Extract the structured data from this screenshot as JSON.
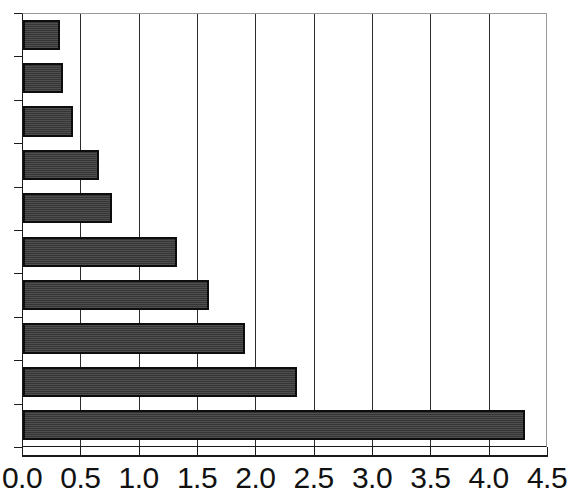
{
  "chart_data": {
    "type": "bar",
    "orientation": "horizontal",
    "title": "",
    "subtitle": "",
    "xlabel": "",
    "ylabel": "",
    "xlim": [
      0.0,
      4.5
    ],
    "xticks": [
      "0.0",
      "0.5",
      "1.0",
      "1.5",
      "2.0",
      "2.5",
      "3.0",
      "3.5",
      "4.0",
      "4.5"
    ],
    "xtick_values": [
      0.0,
      0.5,
      1.0,
      1.5,
      2.0,
      2.5,
      3.0,
      3.5,
      4.0,
      4.5
    ],
    "grid": "vertical",
    "legend": "none",
    "categories": [
      "",
      "",
      "",
      "",
      "",
      "",
      "",
      "",
      "",
      ""
    ],
    "category_labels_clipped": [
      "n",
      "n",
      "n",
      "n",
      "n",
      "n",
      "n",
      "n",
      "n",
      "n"
    ],
    "values": [
      0.32,
      0.34,
      0.43,
      0.65,
      0.76,
      1.32,
      1.59,
      1.9,
      2.35,
      4.3
    ],
    "series": [
      {
        "name": "",
        "values": [
          0.32,
          0.34,
          0.43,
          0.65,
          0.76,
          1.32,
          1.59,
          1.9,
          2.35,
          4.3
        ]
      }
    ]
  },
  "style": {
    "bar_fill": "#3b3b3b",
    "bar_border": "#0d0d0d",
    "gridline_color": "#2b2b2b",
    "axis_color": "#1a1a1a",
    "frame_color": "#9a9a9a",
    "background": "#ffffff",
    "tick_label_color": "#111111"
  },
  "geometry": {
    "plot_left": 22,
    "plot_top": 13,
    "plot_width": 525,
    "plot_height": 434,
    "px_per_unit": 116.67,
    "category_height": 43.4
  }
}
